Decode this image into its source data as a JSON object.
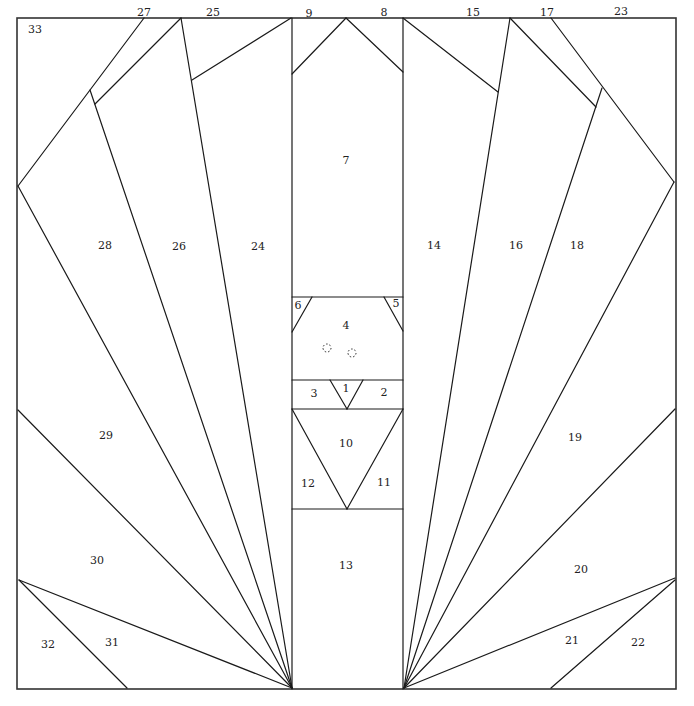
{
  "diagram": {
    "title": "",
    "type": "paper-piecing quilt block pattern",
    "frame": {
      "x1": 17,
      "y1": 18,
      "x2": 676,
      "y2": 689
    },
    "segments": [
      {
        "id": "col-left",
        "x1": 292,
        "y1": 18,
        "x2": 292,
        "y2": 689
      },
      {
        "id": "col-right",
        "x1": 403,
        "y1": 18,
        "x2": 403,
        "y2": 689
      },
      {
        "id": "h-7-4",
        "x1": 292,
        "y1": 297,
        "x2": 403,
        "y2": 297
      },
      {
        "id": "h-4-3",
        "x1": 292,
        "y1": 380,
        "x2": 403,
        "y2": 380
      },
      {
        "id": "h-3-10",
        "x1": 292,
        "y1": 409,
        "x2": 403,
        "y2": 409
      },
      {
        "id": "h-12-13",
        "x1": 292,
        "y1": 509,
        "x2": 403,
        "y2": 509
      },
      {
        "id": "piece9",
        "x1": 346,
        "y1": 18,
        "x2": 292,
        "y2": 74
      },
      {
        "id": "piece8",
        "x1": 346,
        "y1": 18,
        "x2": 403,
        "y2": 72
      },
      {
        "id": "piece6",
        "x1": 312,
        "y1": 297,
        "x2": 292,
        "y2": 332
      },
      {
        "id": "piece5",
        "x1": 384,
        "y1": 297,
        "x2": 403,
        "y2": 331
      },
      {
        "id": "tri1-l",
        "x1": 330,
        "y1": 380,
        "x2": 347,
        "y2": 409
      },
      {
        "id": "tri1-r",
        "x1": 363,
        "y1": 380,
        "x2": 347,
        "y2": 409
      },
      {
        "id": "tri10-l",
        "x1": 292,
        "y1": 409,
        "x2": 347,
        "y2": 509
      },
      {
        "id": "tri10-r",
        "x1": 403,
        "y1": 409,
        "x2": 347,
        "y2": 509
      },
      {
        "id": "piece25",
        "x1": 291,
        "y1": 18,
        "x2": 192,
        "y2": 80
      },
      {
        "id": "ray-24-26",
        "x1": 181,
        "y1": 18,
        "x2": 292,
        "y2": 688
      },
      {
        "id": "piece27",
        "x1": 181,
        "y1": 18,
        "x2": 95,
        "y2": 104
      },
      {
        "id": "piece33",
        "x1": 144,
        "y1": 18,
        "x2": 18,
        "y2": 186
      },
      {
        "id": "ray-26-28",
        "x1": 90,
        "y1": 90,
        "x2": 292,
        "y2": 688
      },
      {
        "id": "ray-28-29",
        "x1": 18,
        "y1": 186,
        "x2": 292,
        "y2": 688
      },
      {
        "id": "ray-29-30",
        "x1": 18,
        "y1": 410,
        "x2": 292,
        "y2": 688
      },
      {
        "id": "ray-30-31",
        "x1": 19,
        "y1": 580,
        "x2": 292,
        "y2": 688
      },
      {
        "id": "piece32",
        "x1": 19,
        "y1": 580,
        "x2": 127,
        "y2": 688
      },
      {
        "id": "piece15",
        "x1": 403,
        "y1": 18,
        "x2": 498,
        "y2": 92
      },
      {
        "id": "ray-14-16",
        "x1": 510,
        "y1": 18,
        "x2": 404,
        "y2": 688
      },
      {
        "id": "piece17",
        "x1": 510,
        "y1": 18,
        "x2": 596,
        "y2": 107
      },
      {
        "id": "piece23",
        "x1": 551,
        "y1": 18,
        "x2": 674,
        "y2": 182
      },
      {
        "id": "ray-16-18",
        "x1": 602,
        "y1": 88,
        "x2": 404,
        "y2": 688
      },
      {
        "id": "ray-18-19",
        "x1": 674,
        "y1": 182,
        "x2": 404,
        "y2": 688
      },
      {
        "id": "ray-19-20",
        "x1": 675,
        "y1": 409,
        "x2": 404,
        "y2": 688
      },
      {
        "id": "ray-20-21",
        "x1": 675,
        "y1": 578,
        "x2": 404,
        "y2": 688
      },
      {
        "id": "piece22",
        "x1": 675,
        "y1": 580,
        "x2": 551,
        "y2": 688
      }
    ],
    "labels": [
      {
        "text": "1",
        "x": 346,
        "y": 389
      },
      {
        "text": "2",
        "x": 384,
        "y": 393
      },
      {
        "text": "3",
        "x": 314,
        "y": 394
      },
      {
        "text": "4",
        "x": 346,
        "y": 326
      },
      {
        "text": "5",
        "x": 396,
        "y": 304
      },
      {
        "text": "6",
        "x": 298,
        "y": 306
      },
      {
        "text": "7",
        "x": 346,
        "y": 161
      },
      {
        "text": "8",
        "x": 384,
        "y": 13
      },
      {
        "text": "9",
        "x": 309,
        "y": 14
      },
      {
        "text": "10",
        "x": 346,
        "y": 444
      },
      {
        "text": "11",
        "x": 384,
        "y": 483
      },
      {
        "text": "12",
        "x": 308,
        "y": 484
      },
      {
        "text": "13",
        "x": 346,
        "y": 566
      },
      {
        "text": "14",
        "x": 434,
        "y": 246
      },
      {
        "text": "15",
        "x": 473,
        "y": 13
      },
      {
        "text": "16",
        "x": 516,
        "y": 246
      },
      {
        "text": "17",
        "x": 547,
        "y": 13
      },
      {
        "text": "18",
        "x": 577,
        "y": 246
      },
      {
        "text": "19",
        "x": 575,
        "y": 438
      },
      {
        "text": "20",
        "x": 581,
        "y": 570
      },
      {
        "text": "21",
        "x": 572,
        "y": 641
      },
      {
        "text": "22",
        "x": 638,
        "y": 643
      },
      {
        "text": "23",
        "x": 621,
        "y": 12
      },
      {
        "text": "24",
        "x": 258,
        "y": 247
      },
      {
        "text": "25",
        "x": 213,
        "y": 13
      },
      {
        "text": "26",
        "x": 179,
        "y": 247
      },
      {
        "text": "27",
        "x": 144,
        "y": 13
      },
      {
        "text": "28",
        "x": 105,
        "y": 246
      },
      {
        "text": "29",
        "x": 106,
        "y": 436
      },
      {
        "text": "30",
        "x": 97,
        "y": 561
      },
      {
        "text": "31",
        "x": 112,
        "y": 643
      },
      {
        "text": "32",
        "x": 48,
        "y": 645
      },
      {
        "text": "33",
        "x": 35,
        "y": 30
      }
    ],
    "dotted_circles": [
      {
        "cx": 327,
        "cy": 348,
        "r": 4
      },
      {
        "cx": 352,
        "cy": 353,
        "r": 4
      }
    ]
  }
}
